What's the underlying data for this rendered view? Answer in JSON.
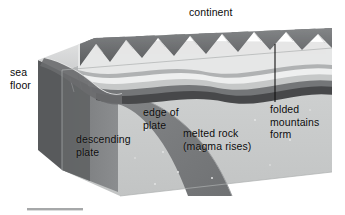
{
  "figure": {
    "background_color": "#ffffff",
    "width": 345,
    "height": 215
  },
  "labels": {
    "continent": "continent",
    "sea_floor": "sea\nfloor",
    "descending_plate": "descending\nplate",
    "edge_of_plate": "edge of\nplate",
    "melted_rock": "melted rock\n(magma rises)",
    "folded_mountains": "folded\nmountains\nform"
  },
  "annotations": {
    "leader_line_label": "folded-mountains-leader-line",
    "scale_bar_label": "scale-bar"
  },
  "colors": {
    "background": "#ffffff",
    "ocean_surface": "#d9dadb",
    "sea_floor_top": "#cfd0d0",
    "block_front_dark": "#6d6e70",
    "block_front_light": "#b9bbbb",
    "mantle_light": "#c9cbcb",
    "mantle_mid": "#a9abac",
    "slab_dark": "#7c7e80",
    "strata_white": "#f0f1f1",
    "strata_light": "#d2d4d4",
    "strata_mid": "#9d9fa0",
    "strata_dark": "#464749",
    "mountain_dark": "#5b5d5f",
    "mountain_mid": "#7e8082",
    "mountain_light": "#a3a5a6",
    "leader_line": "#111111",
    "scale_bar": "#a6a8a9",
    "text": "#0b0b0b"
  }
}
